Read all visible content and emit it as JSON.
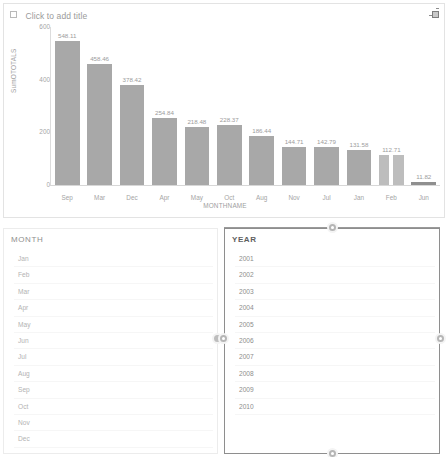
{
  "chart_panel": {
    "title_placeholder": "Click to add title",
    "corner_icon": "resize-expand-icon"
  },
  "chart_data": {
    "type": "bar",
    "title": "Click to add title",
    "xlabel": "MONTHNAME",
    "ylabel": "SumOTOTALS",
    "categories": [
      "Sep",
      "Mar",
      "Dec",
      "Apr",
      "May",
      "Oct",
      "Aug",
      "Nov",
      "Jul",
      "Jan",
      "Feb",
      "Jun"
    ],
    "values": [
      548.11,
      458.46,
      378.42,
      254.84,
      218.48,
      228.37,
      186.44,
      144.71,
      142.79,
      131.58,
      112.71,
      11.82
    ],
    "value_labels": [
      "548.11",
      "458.46",
      "378.42",
      "254.84",
      "218.48",
      "228.37",
      "186.44",
      "144.71",
      "142.79",
      "131.58",
      "112.71",
      "11.82"
    ],
    "yticks": [
      "600",
      "400",
      "200",
      "0"
    ],
    "ytick_values": [
      600,
      400,
      200,
      0
    ],
    "ylim": [
      0,
      600
    ],
    "grid": false,
    "legend": "none",
    "bar_color": "#a8a8a8"
  },
  "month_panel": {
    "header": "MONTH",
    "items": [
      "Jan",
      "Feb",
      "Mar",
      "Apr",
      "May",
      "Jun",
      "Jul",
      "Aug",
      "Sep",
      "Oct",
      "Nov",
      "Dec"
    ]
  },
  "year_panel": {
    "header": "YEAR",
    "items": [
      "2001",
      "2002",
      "2003",
      "2004",
      "2005",
      "2006",
      "2007",
      "2008",
      "2009",
      "2010"
    ],
    "selected": true
  }
}
